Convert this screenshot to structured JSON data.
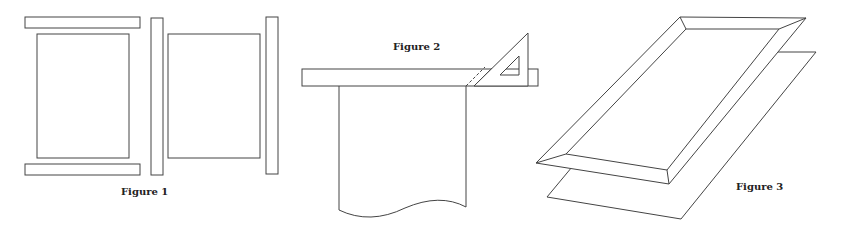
{
  "figures": [
    {
      "id": "figure-1",
      "caption": "Figure 1",
      "description": "Frame parts laid out: two horizontal rails, two vertical stiles, two panels"
    },
    {
      "id": "figure-2",
      "caption": "Figure 2",
      "description": "Straightedge with set square marking a 45 degree miter cut over a sheet"
    },
    {
      "id": "figure-3",
      "caption": "Figure 3",
      "description": "Assembled mitered frame above a sheet in perspective"
    }
  ],
  "colors": {
    "stroke": "#444444",
    "background": "#ffffff",
    "text": "#222222"
  }
}
